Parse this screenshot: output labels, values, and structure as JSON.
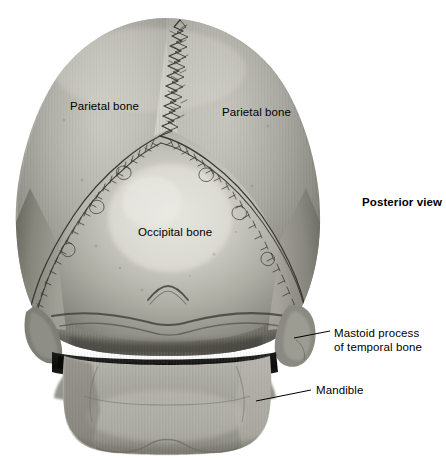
{
  "figure": {
    "view_label": "Posterior view",
    "background_color": "#ffffff",
    "bone_base_color": "#9a9a96",
    "bone_light_color": "#d9d8d2",
    "bone_shadow_color": "#56564f",
    "suture_color": "#3b3b38",
    "label_color": "#000000",
    "leader_color": "#000000"
  },
  "labels": [
    {
      "id": "parietal-bone-left",
      "text": "Parietal bone",
      "x": 70,
      "y": 99,
      "bold": false,
      "has_leader": false
    },
    {
      "id": "parietal-bone-right",
      "text": "Parietal bone",
      "x": 222,
      "y": 105,
      "bold": false,
      "has_leader": false
    },
    {
      "id": "occipital-bone",
      "text": "Occipital bone",
      "x": 138,
      "y": 225,
      "bold": false,
      "has_leader": false
    },
    {
      "id": "posterior-view",
      "text": "Posterior view",
      "x": 362,
      "y": 195,
      "bold": true,
      "has_leader": false
    },
    {
      "id": "mastoid-process",
      "text": "Mastoid process",
      "text_line2": "of temporal bone",
      "x": 334,
      "y": 326,
      "bold": false,
      "has_leader": true
    },
    {
      "id": "mandible",
      "text": "Mandible",
      "x": 316,
      "y": 383,
      "bold": false,
      "has_leader": true
    }
  ],
  "leaders": [
    {
      "id": "leader-mastoid-process",
      "x1": 294,
      "y1": 338,
      "x2": 330,
      "y2": 331
    },
    {
      "id": "leader-mandible",
      "x1": 256,
      "y1": 401,
      "x2": 311,
      "y2": 390
    }
  ],
  "anatomy_parts": [
    {
      "id": "cranial-vault",
      "name": "cranial vault"
    },
    {
      "id": "sagittal-suture",
      "name": "sagittal suture"
    },
    {
      "id": "lambdoid-suture-left",
      "name": "left lambdoid suture"
    },
    {
      "id": "lambdoid-suture-right",
      "name": "right lambdoid suture"
    },
    {
      "id": "occipitomastoid-suture",
      "name": "occipitomastoid suture"
    },
    {
      "id": "external-occipital-protuberance",
      "name": "external occipital protuberance"
    },
    {
      "id": "superior-nuchal-line",
      "name": "superior nuchal line"
    },
    {
      "id": "mastoid-process-left",
      "name": "left mastoid process"
    },
    {
      "id": "mastoid-process-right",
      "name": "right mastoid process"
    },
    {
      "id": "mandible-body",
      "name": "mandible"
    },
    {
      "id": "maxillary-teeth",
      "name": "upper dental arch"
    },
    {
      "id": "mandibular-teeth",
      "name": "lower dental arch"
    }
  ]
}
